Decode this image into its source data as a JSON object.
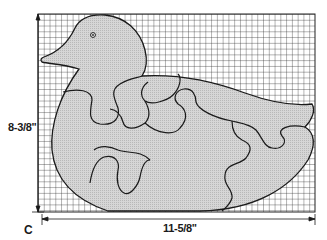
{
  "figure": {
    "letter": "C",
    "height_dimension": "8-3/8\"",
    "width_dimension": "11-5/8\"",
    "pieces": 7,
    "colors": {
      "line": "#1a1a1a",
      "grid": "#2a2a2a",
      "fill": "#cfcfcf",
      "background": "#ffffff"
    }
  }
}
